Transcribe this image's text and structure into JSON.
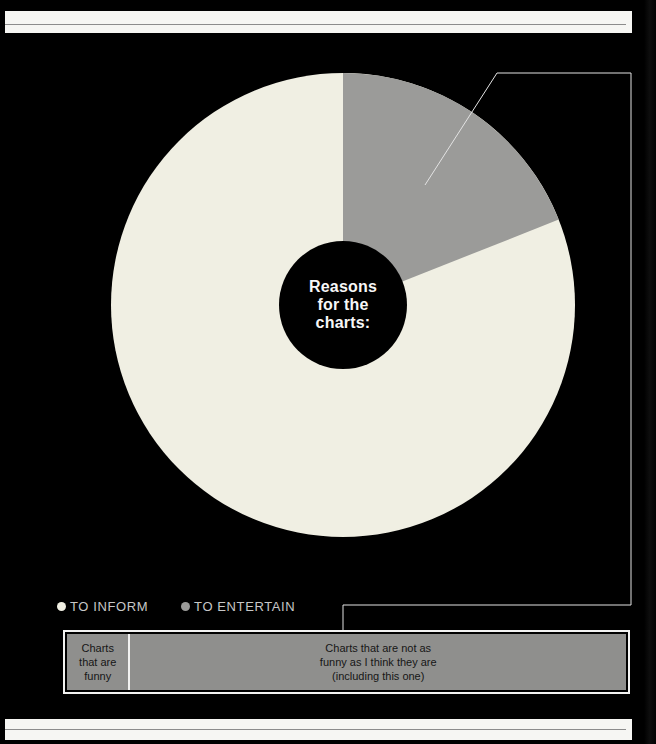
{
  "page": {
    "background": "#000000",
    "band_color": "#f6f6f3",
    "band_rule_color": "#8c8c8c",
    "callout_color": "#e3e3e3"
  },
  "chart_data": [
    {
      "type": "pie",
      "donut": true,
      "center_label": "Reasons\nfor the\ncharts:",
      "center_label_color": "#f7f7f7",
      "hole_color": "#000000",
      "slices_clockwise_from_top": [
        {
          "label": "TO ENTERTAIN",
          "percent": 19,
          "color": "#9b9b99"
        },
        {
          "label": "TO INFORM",
          "percent": 81,
          "color": "#f0efe3"
        }
      ],
      "legend": [
        {
          "label": "TO INFORM",
          "color": "#f0efe3"
        },
        {
          "label": "TO ENTERTAIN",
          "color": "#9b9b99"
        }
      ],
      "legend_position": "bottom-left"
    },
    {
      "type": "bar",
      "orientation": "horizontal-stacked",
      "fill_color": "#8f8f8d",
      "border_color": "#f2f2f1",
      "segments": [
        {
          "label": "Charts\nthat are\nfunny",
          "percent": 11
        },
        {
          "label": "Charts that are not as\nfunny as I think they are\n(including this one)",
          "percent": 89
        }
      ]
    }
  ]
}
